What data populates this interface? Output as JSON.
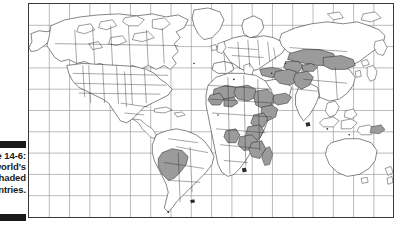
{
  "figure": {
    "caption_visible_fragments": [
      "-6:",
      "d's",
      "ed",
      "es."
    ],
    "caption_text": "Figure 14-6:\nThe world's\nshaded\ncountries.",
    "marker_bar_color": "#1a1a1a",
    "marker_bars": 2
  },
  "map": {
    "projection_type": "world-map-graticule",
    "frame_border_color": "#3a3a3a",
    "graticule": {
      "grid_color": "#8d8d93",
      "vertical_lines": 17,
      "horizontal_lines": 9,
      "visible": true
    },
    "coastline_color": "#202020",
    "land_fill": "#ffffff",
    "highlight_fill": "#9b9b9b",
    "highlighted_regions": [
      "Turkey",
      "Iran",
      "Afghanistan",
      "Pakistan",
      "Kazakhstan",
      "Uzbekistan",
      "Turkmenistan",
      "Kyrgyzstan",
      "Tajikistan",
      "Mongolia",
      "Yemen",
      "Oman",
      "Bolivia",
      "Peru",
      "Mali",
      "Niger",
      "Chad",
      "Sudan",
      "Ethiopia",
      "Somalia",
      "Kenya",
      "Tanzania",
      "Zambia",
      "Zimbabwe",
      "Mozambique",
      "Angola",
      "Guinea",
      "Burkina Faso",
      "Madagascar"
    ],
    "unshaded_regions": [
      "United States",
      "Canada",
      "Mexico",
      "Brazil",
      "Argentina",
      "Australia",
      "China",
      "India",
      "Russia",
      "Europe"
    ]
  }
}
